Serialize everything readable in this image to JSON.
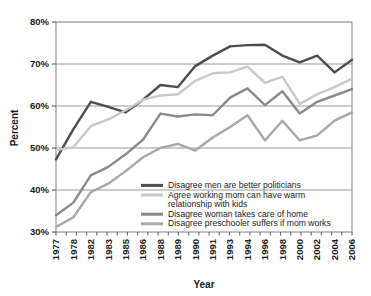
{
  "chart_data": {
    "type": "line",
    "title": "",
    "xlabel": "Year",
    "ylabel": "Percent",
    "ylim": [
      30,
      80
    ],
    "ytick_labels": [
      "30%",
      "40%",
      "50%",
      "60%",
      "70%",
      "80%"
    ],
    "ytick_values": [
      30,
      40,
      50,
      60,
      70,
      80
    ],
    "grid": "horizontal",
    "legend_position": "inside-bottom-center",
    "x": [
      1977,
      1978,
      1982,
      1983,
      1985,
      1986,
      1988,
      1989,
      1990,
      1991,
      1993,
      1994,
      1996,
      1998,
      2000,
      2002,
      2004,
      2006
    ],
    "xtick_labels": [
      "1977",
      "1978",
      "1982",
      "1983",
      "1985",
      "1986",
      "1988",
      "1989",
      "1990",
      "1991",
      "1993",
      "1994",
      "1996",
      "1998",
      "2000",
      "2002",
      "2004",
      "2006"
    ],
    "series": [
      {
        "name": "Disagree men are better politicians",
        "color": "#4d4d4d",
        "values": [
          47.3,
          54.5,
          61.0,
          59.8,
          58.5,
          61.5,
          65.0,
          64.5,
          69.5,
          72.0,
          74.2,
          74.5,
          74.6,
          72.0,
          70.4,
          72.0,
          68.0,
          71.0
        ]
      },
      {
        "name": "Agree working mom can have warm relationship with kids",
        "color": "#c9c9c9",
        "values": [
          49.5,
          50.2,
          55.2,
          56.8,
          59.0,
          61.5,
          62.5,
          62.8,
          66.0,
          67.8,
          68.0,
          69.4,
          65.5,
          67.0,
          60.5,
          62.8,
          64.5,
          66.5
        ]
      },
      {
        "name": "Disagree woman takes care of home",
        "color": "#8a8a8a",
        "values": [
          34.0,
          37.0,
          43.5,
          45.5,
          48.5,
          52.0,
          58.2,
          57.5,
          58.0,
          57.8,
          62.0,
          64.2,
          60.2,
          63.5,
          58.2,
          61.0,
          62.5,
          64.0
        ]
      },
      {
        "name": "Disagree preschooler suffers if mom works",
        "color": "#a8a8a8",
        "values": [
          31.2,
          33.5,
          39.5,
          41.5,
          44.5,
          47.8,
          50.0,
          51.0,
          49.4,
          52.5,
          55.0,
          57.8,
          51.8,
          56.5,
          51.8,
          53.0,
          56.5,
          58.5
        ]
      }
    ],
    "legend_entries": [
      {
        "label": "Disagree men are better politicians",
        "color": "#4d4d4d"
      },
      {
        "label": "Agree working mom can have warm",
        "label2": "relationship with kids",
        "color": "#c9c9c9"
      },
      {
        "label": "Disagree woman takes care of home",
        "color": "#8a8a8a"
      },
      {
        "label": "Disagree preschooler suffers if mom works",
        "color": "#a8a8a8"
      }
    ]
  }
}
